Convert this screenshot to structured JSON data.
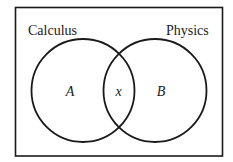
{
  "diagram": {
    "type": "venn",
    "colors": {
      "background": "#ffffff",
      "stroke": "#1a1a1a",
      "text": "#1a1a1a"
    },
    "sets": [
      {
        "name": "Calculus",
        "region_label": "A"
      },
      {
        "name": "Physics",
        "region_label": "B"
      }
    ],
    "intersection_label": "x"
  }
}
